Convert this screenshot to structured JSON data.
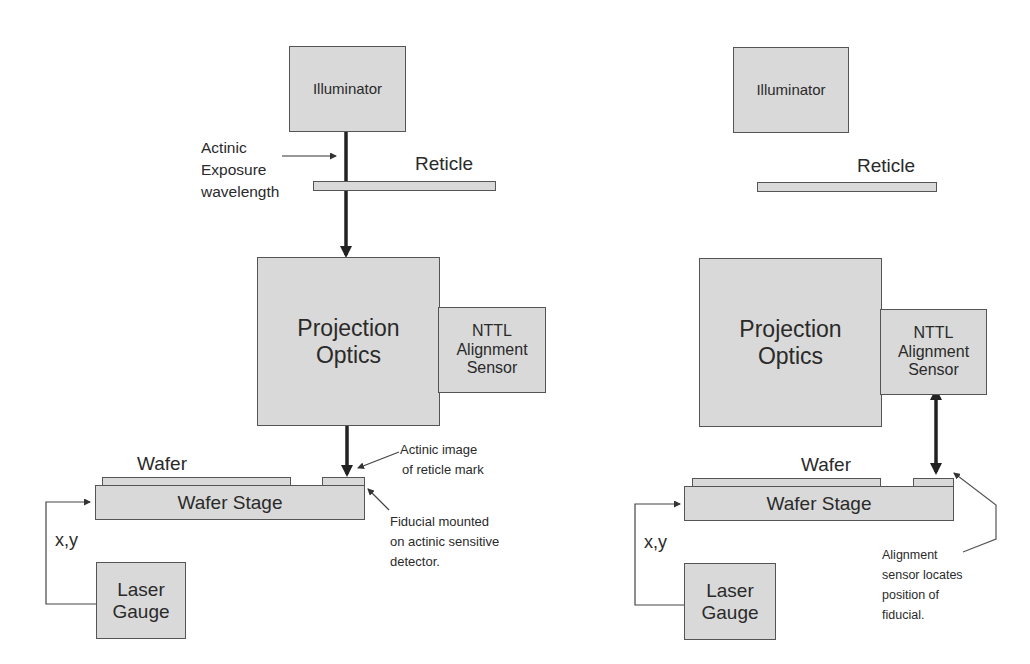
{
  "panels": [
    {
      "illuminator": "Illuminator",
      "reticle": "Reticle",
      "exposure_label": [
        "Actinic",
        "Exposure",
        "wavelength"
      ],
      "projection_optics": [
        "Projection",
        "Optics"
      ],
      "sensor": [
        "NTTL",
        "Alignment",
        "Sensor"
      ],
      "wafer": "Wafer",
      "wafer_stage": "Wafer Stage",
      "xy": "x,y",
      "laser_gauge": [
        "Laser",
        "Gauge"
      ],
      "annotation_top": [
        "Actinic image",
        "of reticle mark"
      ],
      "annotation_bottom": [
        "Fiducial mounted",
        "on actinic sensitive",
        "detector."
      ]
    },
    {
      "illuminator": "Illuminator",
      "reticle": "Reticle",
      "projection_optics": [
        "Projection",
        "Optics"
      ],
      "sensor": [
        "NTTL",
        "Alignment",
        "Sensor"
      ],
      "wafer": "Wafer",
      "wafer_stage": "Wafer Stage",
      "xy": "x,y",
      "laser_gauge": [
        "Laser",
        "Gauge"
      ],
      "annotation_bottom": [
        "Alignment",
        "sensor locates",
        "position of",
        "fiducial."
      ]
    }
  ],
  "colors": {
    "box_fill": "#d9d9d9",
    "stroke": "#555555",
    "arrow": "#222222"
  }
}
